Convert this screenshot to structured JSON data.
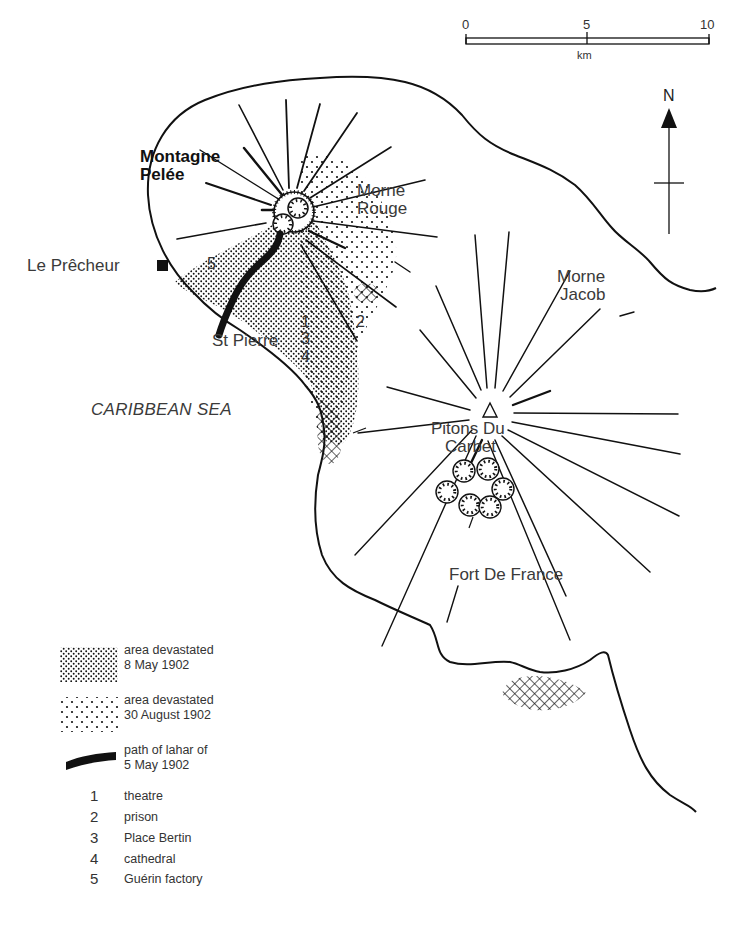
{
  "scale_bar": {
    "ticks": [
      "0",
      "5",
      "10"
    ],
    "unit": "km"
  },
  "north_arrow": {
    "label": "N"
  },
  "places": {
    "volcano": "Montagne Pelée",
    "volcano_line1": "Montagne",
    "volcano_line2": "Pelée",
    "le_precheur": "Le Prêcheur",
    "morne_rouge_line1": "Morne",
    "morne_rouge_line2": "Rouge",
    "morne_jacob_line1": "Morne",
    "morne_jacob_line2": "Jacob",
    "st_pierre": "St Pierre",
    "pitons_line1": "Pitons Du",
    "pitons_line2": "Carbet",
    "fort_de_france": "Fort De France",
    "sea": "CARIBBEAN SEA"
  },
  "map_markers": {
    "n1": "1",
    "n2": "2",
    "n3": "3",
    "n4": "4",
    "n5": "5"
  },
  "legend": {
    "symbols": [
      {
        "pattern": "dense-dots",
        "line1": "area devastated",
        "line2": "8 May 1902"
      },
      {
        "pattern": "sparse-dots",
        "line1": "area devastated",
        "line2": "30 August 1902"
      },
      {
        "pattern": "thick-black-line",
        "line1": "path of lahar of",
        "line2": "5 May 1902"
      }
    ],
    "keys": [
      {
        "num": "1",
        "label": "theatre"
      },
      {
        "num": "2",
        "label": "prison"
      },
      {
        "num": "3",
        "label": "Place Bertin"
      },
      {
        "num": "4",
        "label": "cathedral"
      },
      {
        "num": "5",
        "label": "Guérin factory"
      }
    ]
  },
  "colors": {
    "ink": "#111111",
    "text": "#333333",
    "background": "#ffffff"
  }
}
